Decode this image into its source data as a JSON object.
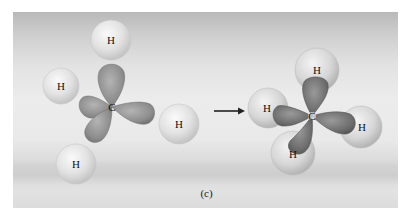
{
  "figure": {
    "caption": "(c)",
    "background_color": "#e6e6e6",
    "left_molecule": {
      "description": "Carbon with sp3 hybrid orbitals and four separate hydrogen atoms",
      "carbon": {
        "label": "C",
        "x": 112,
        "y": 107
      },
      "hydrogens": [
        {
          "label": "H",
          "x": 111,
          "y": 40,
          "r": 20
        },
        {
          "label": "H",
          "x": 61,
          "y": 86,
          "r": 18
        },
        {
          "label": "H",
          "x": 179,
          "y": 124,
          "r": 20
        },
        {
          "label": "H",
          "x": 76,
          "y": 164,
          "r": 20
        }
      ],
      "orbital_color": "#8e8e8e"
    },
    "arrow": {
      "x1": 214,
      "x2": 244,
      "y": 111,
      "color": "#222222"
    },
    "right_molecule": {
      "description": "Methane (CH4) formed by overlap of sp3 orbitals with H 1s orbitals",
      "carbon": {
        "label": "C",
        "x": 312,
        "y": 116
      },
      "hydrogens": [
        {
          "label": "H",
          "x": 317,
          "y": 70,
          "r": 22
        },
        {
          "label": "H",
          "x": 268,
          "y": 108,
          "r": 20
        },
        {
          "label": "H",
          "x": 361,
          "y": 127,
          "r": 21
        },
        {
          "label": "H",
          "x": 293,
          "y": 153,
          "r": 22
        }
      ],
      "orbital_color": "#6e6e6e"
    }
  }
}
